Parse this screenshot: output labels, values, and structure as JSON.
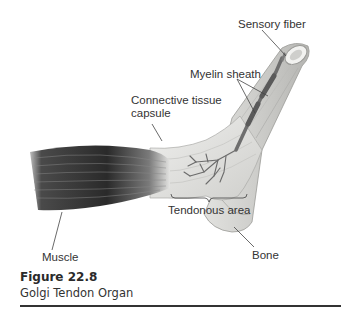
{
  "figure": {
    "number": "Figure 22.8",
    "caption": "Golgi Tendon Organ",
    "labels": {
      "sensory_fiber": "Sensory fiber",
      "myelin_sheath": "Myelin sheath",
      "connective_tissue_capsule_line1": "Connective tissue",
      "connective_tissue_capsule_line2": "capsule",
      "tendonous_area": "Tendonous area",
      "muscle": "Muscle",
      "bone": "Bone"
    },
    "colors": {
      "muscle_dark": "#2b2b2b",
      "tendon": "#e6e6e4",
      "bone": "#d7d7d4",
      "line": "#444444"
    }
  }
}
